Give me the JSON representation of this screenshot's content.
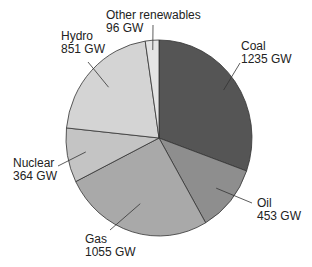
{
  "chart_data": {
    "type": "pie",
    "title": "",
    "unit": "GW",
    "categories": [
      "Coal",
      "Oil",
      "Gas",
      "Nuclear",
      "Hydro",
      "Other renewables"
    ],
    "values": [
      1235,
      453,
      1055,
      364,
      851,
      96
    ],
    "colors": [
      "#555555",
      "#8e8e8e",
      "#a9a9a9",
      "#c4c4c4",
      "#d4d4d4",
      "#e4e4e4"
    ],
    "start_angle_deg": 0,
    "direction": "clockwise",
    "legend": "none (direct labels with leader lines)"
  },
  "labels": [
    {
      "name": "Coal",
      "value": "1235 GW"
    },
    {
      "name": "Oil",
      "value": "453 GW"
    },
    {
      "name": "Gas",
      "value": "1055 GW"
    },
    {
      "name": "Nuclear",
      "value": "364 GW"
    },
    {
      "name": "Hydro",
      "value": "851 GW"
    },
    {
      "name": "Other renewables",
      "value": "96 GW"
    }
  ]
}
